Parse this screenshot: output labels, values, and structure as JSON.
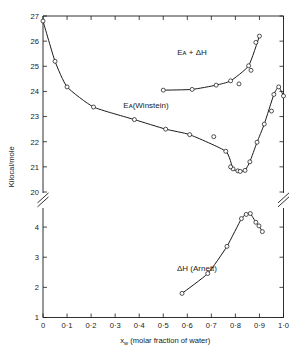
{
  "figure": {
    "background_color": "#ffffff",
    "line_color": "#1a1a1a",
    "marker_fill": "#ffffff",
    "axis_break_note": "y-axis broken between 20 and 4"
  },
  "axes": {
    "y": {
      "label": "Kilocal/mole",
      "upper_ticks": [
        "20",
        "21",
        "22",
        "23",
        "24",
        "25",
        "26",
        "27"
      ],
      "lower_ticks": [
        "1",
        "2",
        "3",
        "4"
      ],
      "upper_range": [
        20,
        27
      ],
      "lower_range": [
        1,
        4.6
      ],
      "has_break": true
    },
    "x": {
      "label_main": "(molar fraction of water)",
      "label_symbol": "x",
      "label_subscript": "w",
      "ticks": [
        "0",
        "0·1",
        "0·2",
        "0·3",
        "0·4",
        "0·5",
        "0·6",
        "0·7",
        "0·8",
        "0·9",
        "1·0"
      ],
      "range": [
        0,
        1
      ]
    }
  },
  "labels": {
    "ea_plus_dh": "Eᴀ + ΔH",
    "ea_winstein": "Eᴀ(Winstein)",
    "dh_arnett": "ΔH (Arnett)"
  },
  "chart_data": {
    "type": "line",
    "title": "",
    "xlabel": "x_w (molar fraction of water)",
    "ylabel": "Kilocal/mole",
    "xlim": [
      0,
      1
    ],
    "ylim_upper": [
      20,
      27
    ],
    "ylim_lower": [
      1,
      4.6
    ],
    "grid": false,
    "legend": "inline annotations",
    "y_axis_break": {
      "between": [
        20,
        4
      ],
      "style": "double-slash"
    },
    "series": [
      {
        "name": "E_A(Winstein)",
        "marker": "open-circle",
        "axis": "upper",
        "points": [
          {
            "x": 0.0,
            "y": 26.8
          },
          {
            "x": 0.05,
            "y": 25.2
          },
          {
            "x": 0.1,
            "y": 24.18
          },
          {
            "x": 0.21,
            "y": 23.38
          },
          {
            "x": 0.38,
            "y": 22.88
          },
          {
            "x": 0.51,
            "y": 22.5
          },
          {
            "x": 0.61,
            "y": 22.28
          },
          {
            "x": 0.76,
            "y": 21.62
          },
          {
            "x": 0.79,
            "y": 20.92
          },
          {
            "x": 0.81,
            "y": 20.84
          },
          {
            "x": 0.82,
            "y": 20.82
          },
          {
            "x": 0.84,
            "y": 20.86
          },
          {
            "x": 0.86,
            "y": 21.2
          },
          {
            "x": 0.89,
            "y": 21.98
          },
          {
            "x": 0.92,
            "y": 22.7
          },
          {
            "x": 0.96,
            "y": 23.88
          },
          {
            "x": 0.98,
            "y": 24.18
          },
          {
            "x": 1.0,
            "y": 23.82
          }
        ]
      },
      {
        "name": "E_A(Winstein) scatter",
        "marker": "open-circle",
        "axis": "upper",
        "note": "off-curve data points",
        "points": [
          {
            "x": 0.71,
            "y": 22.2
          },
          {
            "x": 0.78,
            "y": 21.0
          },
          {
            "x": 0.95,
            "y": 23.22
          }
        ]
      },
      {
        "name": "E_A + ΔH",
        "marker": "open-circle",
        "axis": "upper",
        "points": [
          {
            "x": 0.5,
            "y": 24.05
          },
          {
            "x": 0.62,
            "y": 24.08
          },
          {
            "x": 0.72,
            "y": 24.25
          },
          {
            "x": 0.78,
            "y": 24.42
          },
          {
            "x": 0.855,
            "y": 25.02
          },
          {
            "x": 0.9,
            "y": 26.2
          }
        ]
      },
      {
        "name": "E_A + ΔH scatter",
        "marker": "open-circle",
        "axis": "upper",
        "note": "off-curve data points",
        "points": [
          {
            "x": 0.815,
            "y": 24.3
          },
          {
            "x": 0.865,
            "y": 24.84
          },
          {
            "x": 0.885,
            "y": 25.95
          }
        ]
      },
      {
        "name": "ΔH (Arnett)",
        "marker": "open-circle",
        "axis": "lower",
        "points": [
          {
            "x": 0.578,
            "y": 1.8
          },
          {
            "x": 0.685,
            "y": 2.46
          },
          {
            "x": 0.765,
            "y": 3.36
          },
          {
            "x": 0.825,
            "y": 4.28
          },
          {
            "x": 0.845,
            "y": 4.42
          },
          {
            "x": 0.862,
            "y": 4.45
          },
          {
            "x": 0.885,
            "y": 4.16
          },
          {
            "x": 0.898,
            "y": 4.04
          },
          {
            "x": 0.912,
            "y": 3.85
          }
        ]
      }
    ]
  }
}
